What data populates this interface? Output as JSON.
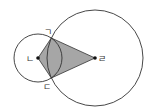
{
  "diagram": {
    "type": "geometry",
    "colors": {
      "stroke": "#333333",
      "fill": "#a6a6a6",
      "background": "#ffffff"
    },
    "small_circle": {
      "cx": 38,
      "cy": 58,
      "r": 24
    },
    "big_circle": {
      "cx": 95,
      "cy": 58,
      "r": 48
    },
    "points": {
      "giyeok": {
        "label": "ㄱ",
        "x": 51.3,
        "y": 38
      },
      "nieun": {
        "label": "ㄴ",
        "x": 38,
        "y": 58
      },
      "digeut": {
        "label": "ㄷ",
        "x": 51.3,
        "y": 78
      },
      "rieul": {
        "label": "ㄹ",
        "x": 95,
        "y": 58
      }
    },
    "labels": {
      "giyeok": "ㄱ",
      "nieun": "ㄴ",
      "digeut": "ㄷ",
      "rieul": "ㄹ"
    }
  }
}
